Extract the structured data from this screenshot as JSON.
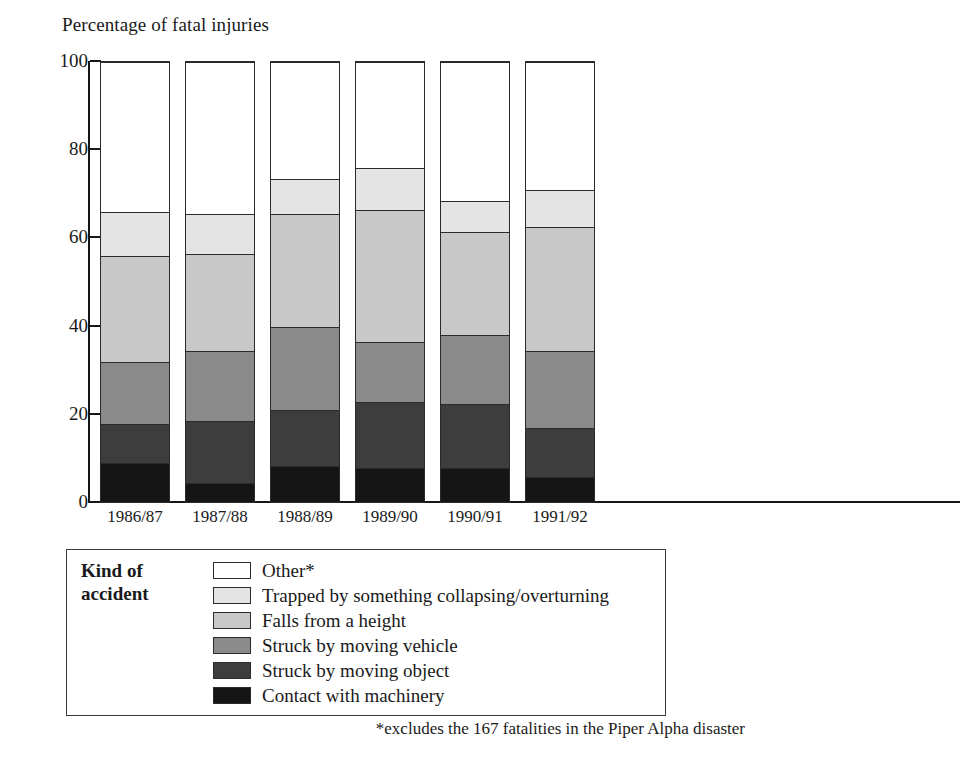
{
  "chart_data": {
    "type": "bar",
    "stacked": true,
    "title": "Percentage of fatal injuries",
    "xlabel": "",
    "ylabel": "Percentage of fatal injuries",
    "ylim": [
      0,
      100
    ],
    "yticks": [
      0,
      20,
      40,
      60,
      80,
      100
    ],
    "grid": false,
    "legend_position": "below-plot",
    "legend_title": "Kind of accident",
    "categories": [
      "1986/87",
      "1987/88",
      "1988/89",
      "1989/90",
      "1990/91",
      "1991/92"
    ],
    "series": [
      {
        "name": "Contact with machinery",
        "color": "#151515",
        "values": [
          9.0,
          4.5,
          8.5,
          8.0,
          8.0,
          6.0
        ]
      },
      {
        "name": "Struck by moving object",
        "color": "#3d3d3d",
        "values": [
          9.0,
          14.0,
          12.5,
          15.0,
          14.5,
          11.0
        ]
      },
      {
        "name": "Struck by moving vehicle",
        "color": "#8a8a8a",
        "values": [
          14.0,
          16.0,
          19.0,
          13.5,
          15.5,
          17.5
        ]
      },
      {
        "name": "Falls from a height",
        "color": "#c8c8c8",
        "values": [
          24.0,
          22.0,
          25.5,
          30.0,
          23.5,
          28.0
        ]
      },
      {
        "name": "Trapped by something collapsing/overturning",
        "color": "#e4e4e4",
        "values": [
          10.0,
          9.0,
          8.0,
          9.5,
          7.0,
          8.5
        ]
      },
      {
        "name": "Other*",
        "color": "#ffffff",
        "values": [
          34.0,
          34.5,
          26.5,
          24.0,
          31.5,
          29.0
        ]
      }
    ],
    "cumulative_tops": {
      "1986/87": [
        9,
        18,
        32,
        56,
        66,
        100
      ],
      "1987/88": [
        4.5,
        18.5,
        34.5,
        56.5,
        65.5,
        100
      ],
      "1988/89": [
        8.5,
        21,
        40,
        65.5,
        73.5,
        100
      ],
      "1989/90": [
        8,
        23,
        36.5,
        66.5,
        76,
        100
      ],
      "1990/91": [
        8,
        22.5,
        38,
        61.5,
        68.5,
        100
      ],
      "1991/92": [
        6,
        17,
        34.5,
        62.5,
        71,
        100
      ]
    },
    "footnote": "*excludes the 167 fatalities in the Piper Alpha disaster"
  },
  "legend": {
    "title_line1": "Kind of",
    "title_line2": "accident",
    "items": [
      {
        "label": "Other*",
        "color": "#ffffff"
      },
      {
        "label": "Trapped by something collapsing/overturning",
        "color": "#e4e4e4"
      },
      {
        "label": "Falls from a height",
        "color": "#c8c8c8"
      },
      {
        "label": "Struck by moving vehicle",
        "color": "#8a8a8a"
      },
      {
        "label": "Struck by moving object",
        "color": "#3d3d3d"
      },
      {
        "label": "Contact with machinery",
        "color": "#151515"
      }
    ]
  },
  "axis": {
    "y_labels": [
      "100",
      "80",
      "60",
      "40",
      "20",
      "0"
    ],
    "x_labels": [
      "1986/87",
      "1987/88",
      "1988/89",
      "1989/90",
      "1990/91",
      "1991/92"
    ]
  }
}
